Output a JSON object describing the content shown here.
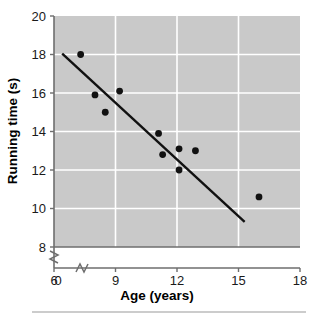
{
  "chart_data": {
    "type": "scatter",
    "title": "",
    "xlabel": "Age (years)",
    "ylabel": "Running time (s)",
    "xlim": [
      6,
      18
    ],
    "ylim": [
      8,
      20
    ],
    "xticks": [
      0,
      6,
      9,
      12,
      15,
      18
    ],
    "yticks": [
      8,
      10,
      12,
      14,
      16,
      18,
      20
    ],
    "xtick_labels": [
      "0",
      "6",
      "9",
      "12",
      "15",
      "18"
    ],
    "ytick_labels": [
      "8",
      "10",
      "12",
      "14",
      "16",
      "18",
      "20"
    ],
    "grid": true,
    "legend": null,
    "axis_break_x": true,
    "axis_break_y": true,
    "plot_background": "#c9c9c9",
    "gridline_color": "#ffffff",
    "marker_color": "#111111",
    "trendline_color": "#111111",
    "points": [
      {
        "x": 7.3,
        "y": 18.0
      },
      {
        "x": 8.0,
        "y": 15.9
      },
      {
        "x": 8.5,
        "y": 15.0
      },
      {
        "x": 9.2,
        "y": 16.1
      },
      {
        "x": 11.1,
        "y": 13.9
      },
      {
        "x": 11.3,
        "y": 12.8
      },
      {
        "x": 12.1,
        "y": 13.1
      },
      {
        "x": 12.1,
        "y": 12.0
      },
      {
        "x": 12.9,
        "y": 13.0
      },
      {
        "x": 16.0,
        "y": 10.6
      }
    ],
    "trendline": {
      "x1": 6.4,
      "y1": 18.05,
      "x2": 15.3,
      "y2": 9.3
    }
  },
  "figure": {
    "footer_rule": true
  }
}
